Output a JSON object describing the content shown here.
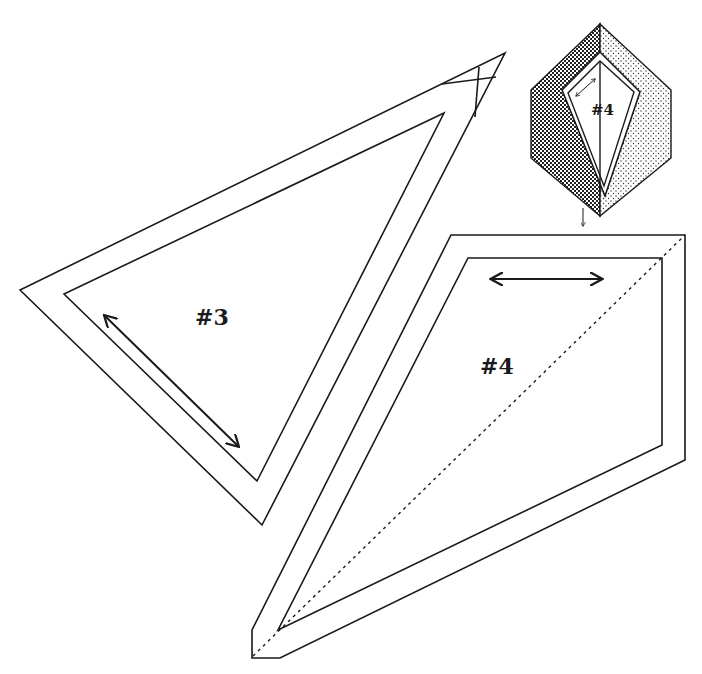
{
  "diagram": {
    "type": "quilt-pattern-templates",
    "pieces": [
      {
        "id": "piece-3",
        "label": "#3",
        "shape": "triangle",
        "grain_arrow": "diagonal double-headed arrow along left edge"
      },
      {
        "id": "piece-4",
        "label": "#4",
        "shape": "kite quadrilateral",
        "grain_arrow": "horizontal double-headed arrow near top edge",
        "fold_line": "dotted diagonal"
      }
    ],
    "inset": {
      "label": "#4",
      "shape": "hexagon block with kite center",
      "left_fill": "checkered pattern",
      "right_fill": "stippled pattern",
      "pointer": "down arrow"
    },
    "colors": {
      "line": "#1a1a1a",
      "background": "#ffffff"
    }
  }
}
